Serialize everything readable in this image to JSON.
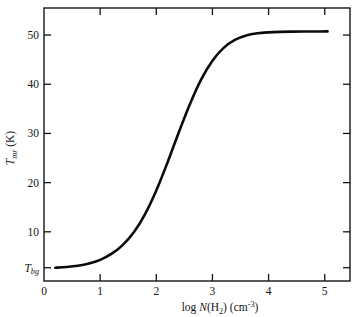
{
  "chart_data": {
    "type": "line",
    "title": "",
    "xlabel": "log N(H2) (cm-3)",
    "xlabel_parts": {
      "log": "log ",
      "n": "N",
      "open": "(H",
      "sub2": "2",
      "close": ") (cm",
      "sup": "-3",
      "tail": ")"
    },
    "ylabel": "Tmr (K)",
    "ylabel_parts": {
      "t": "T",
      "sub": "mr",
      "unit": " (K)"
    },
    "xlim": [
      0,
      5.45
    ],
    "ylim": [
      0,
      55.5
    ],
    "grid": false,
    "legend": null,
    "x_ticks": [
      {
        "value": 0,
        "label": "0"
      },
      {
        "value": 1,
        "label": "1"
      },
      {
        "value": 2,
        "label": "2"
      },
      {
        "value": 3,
        "label": "3"
      },
      {
        "value": 4,
        "label": "4"
      },
      {
        "value": 5,
        "label": "5"
      }
    ],
    "y_ticks": [
      {
        "value": 2.7,
        "label": "Tbg",
        "special": true,
        "label_parts": {
          "t": "T",
          "sub": "bg"
        }
      },
      {
        "value": 10,
        "label": "10"
      },
      {
        "value": 20,
        "label": "20"
      },
      {
        "value": 30,
        "label": "30"
      },
      {
        "value": 40,
        "label": "40"
      },
      {
        "value": 50,
        "label": "50"
      }
    ],
    "series": [
      {
        "name": "Tmr vs log N(H2)",
        "color": "#0b0b0b",
        "x": [
          0.2,
          0.4,
          0.6,
          0.8,
          1.0,
          1.2,
          1.4,
          1.6,
          1.8,
          2.0,
          2.2,
          2.4,
          2.6,
          2.8,
          3.0,
          3.2,
          3.4,
          3.6,
          3.8,
          4.0,
          4.2,
          4.4,
          4.6,
          4.8,
          5.05
        ],
        "y": [
          2.7,
          2.85,
          3.1,
          3.55,
          4.3,
          5.5,
          7.3,
          9.9,
          13.6,
          18.4,
          24.1,
          30.2,
          36.0,
          41.0,
          44.8,
          47.4,
          49.0,
          49.9,
          50.35,
          50.55,
          50.65,
          50.7,
          50.72,
          50.73,
          50.74
        ]
      }
    ],
    "annotations": [
      {
        "name": "baseline-label",
        "text": "Tbg",
        "x": 0.0,
        "y": 2.7
      }
    ]
  },
  "figure": {
    "background": "#ffffff",
    "foreground": "#141414"
  }
}
